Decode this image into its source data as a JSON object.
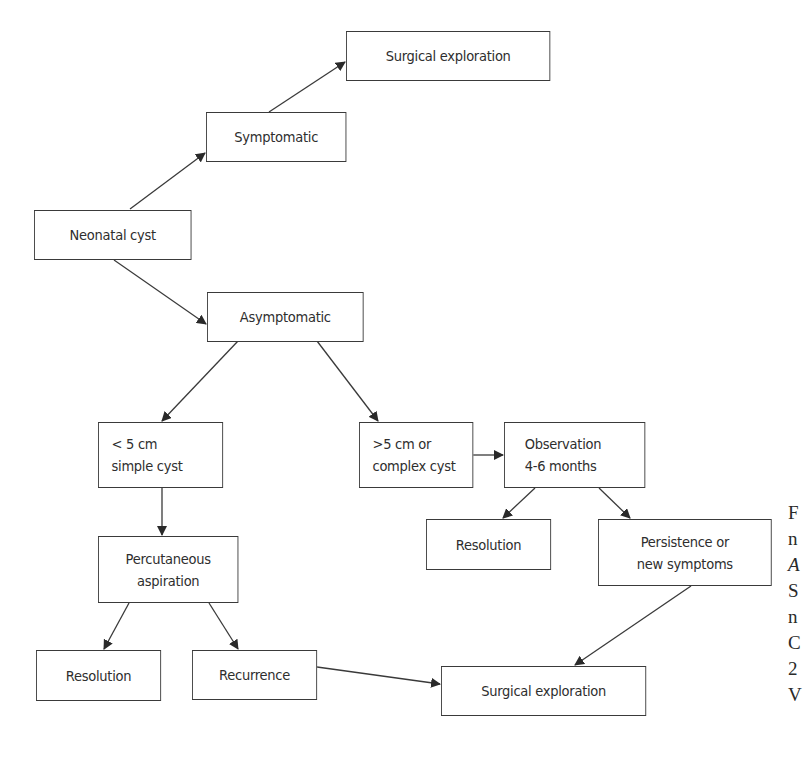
{
  "diagram": {
    "type": "flowchart",
    "nodes": [
      {
        "id": "surgical_top",
        "lines": [
          "Surgical exploration"
        ]
      },
      {
        "id": "symptomatic",
        "lines": [
          "Symptomatic"
        ]
      },
      {
        "id": "neonatal",
        "lines": [
          "Neonatal cyst"
        ]
      },
      {
        "id": "asymptomatic",
        "lines": [
          "Asymptomatic"
        ]
      },
      {
        "id": "small_simple",
        "lines": [
          "< 5 cm",
          "simple cyst"
        ]
      },
      {
        "id": "large_complex",
        "lines": [
          ">5 cm or",
          "complex cyst"
        ]
      },
      {
        "id": "observation",
        "lines": [
          "Observation",
          "4-6 months"
        ]
      },
      {
        "id": "resolution_mid",
        "lines": [
          "Resolution"
        ]
      },
      {
        "id": "persistence",
        "lines": [
          "Persistence or",
          "new symptoms"
        ]
      },
      {
        "id": "percutaneous",
        "lines": [
          "Percutaneous",
          "aspiration"
        ]
      },
      {
        "id": "resolution_bottom",
        "lines": [
          "Resolution"
        ]
      },
      {
        "id": "recurrence",
        "lines": [
          "Recurrence"
        ]
      },
      {
        "id": "surgical_bottom",
        "lines": [
          "Surgical exploration"
        ]
      }
    ],
    "edges": [
      {
        "from": "neonatal",
        "to": "symptomatic"
      },
      {
        "from": "symptomatic",
        "to": "surgical_top"
      },
      {
        "from": "neonatal",
        "to": "asymptomatic"
      },
      {
        "from": "asymptomatic",
        "to": "small_simple"
      },
      {
        "from": "asymptomatic",
        "to": "large_complex"
      },
      {
        "from": "large_complex",
        "to": "observation"
      },
      {
        "from": "observation",
        "to": "resolution_mid"
      },
      {
        "from": "observation",
        "to": "persistence"
      },
      {
        "from": "small_simple",
        "to": "percutaneous"
      },
      {
        "from": "percutaneous",
        "to": "resolution_bottom"
      },
      {
        "from": "percutaneous",
        "to": "recurrence"
      },
      {
        "from": "recurrence",
        "to": "surgical_bottom"
      },
      {
        "from": "persistence",
        "to": "surgical_bottom"
      }
    ]
  },
  "caption_fragment": [
    "F",
    "n",
    "A",
    "S",
    "n",
    "C",
    "2",
    "V"
  ],
  "colors": {
    "line": "#3a3a3a",
    "text": "#2e2e2e",
    "background": "#ffffff"
  }
}
